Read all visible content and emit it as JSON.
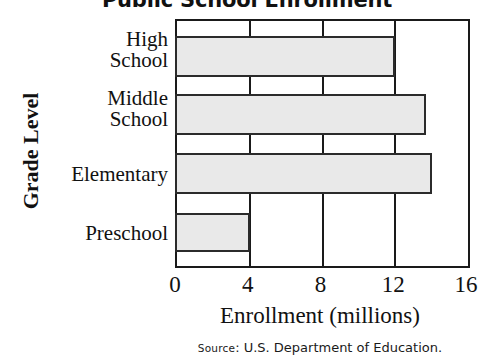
{
  "chart_data": {
    "type": "bar",
    "orientation": "horizontal",
    "title": "Public School Enrollment",
    "xlabel": "Enrollment (millions)",
    "ylabel": "Grade Level",
    "categories": [
      "High\nSchool",
      "Middle\nSchool",
      "Elementary",
      "Preschool"
    ],
    "values": [
      12,
      13.7,
      14,
      4
    ],
    "xlim": [
      0,
      16
    ],
    "xticks": [
      0,
      4,
      8,
      12,
      16
    ],
    "xtick_labels": [
      "0",
      "4",
      "8",
      "12",
      "16"
    ],
    "grid": "vertical gridlines at 4, 8, 12",
    "legend": "none",
    "bar_fill_color": "#e9e9e9",
    "bar_border_color": "#2b2b2b",
    "axis_color": "#1a1a1a",
    "source": "Source: U.S. Department of Education."
  },
  "title": {
    "text": "Public School Enrollment"
  },
  "axes": {
    "y_title": "Grade Level",
    "x_title": "Enrollment (millions)",
    "x_ticks": [
      {
        "label": "0",
        "value": 0
      },
      {
        "label": "4",
        "value": 4
      },
      {
        "label": "8",
        "value": 8
      },
      {
        "label": "12",
        "value": 12
      },
      {
        "label": "16",
        "value": 16
      }
    ]
  },
  "bars": [
    {
      "label": "High\nSchool",
      "value": 12
    },
    {
      "label": "Middle\nSchool",
      "value": 13.7
    },
    {
      "label": "Elementary",
      "value": 14
    },
    {
      "label": "Preschool",
      "value": 4
    }
  ],
  "source": {
    "prefix": "Source",
    "separator": ": ",
    "text": "U.S. Department of Education."
  }
}
